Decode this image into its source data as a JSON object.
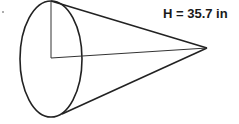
{
  "diagram": {
    "type": "cone",
    "orientation": "horizontal",
    "height_label": "H = 35.7 in",
    "stroke_color": "#222222",
    "background_color": "#ffffff"
  }
}
